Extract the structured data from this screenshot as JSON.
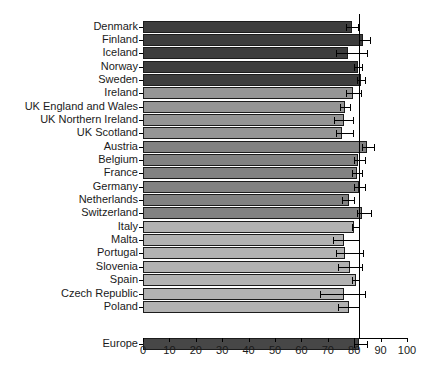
{
  "chart_data": {
    "type": "bar",
    "orientation": "horizontal",
    "title": "",
    "xlabel": "",
    "ylabel": "",
    "xlim": [
      0,
      100
    ],
    "x_tick_labels": [
      "0",
      "10",
      "20",
      "30",
      "40",
      "50",
      "60",
      "70",
      "80",
      "90",
      "100"
    ],
    "x_tick_values": [
      0,
      10,
      20,
      30,
      40,
      50,
      60,
      70,
      80,
      90,
      100
    ],
    "grid": false,
    "legend": "none",
    "reference_line": {
      "value": 82,
      "color": "#000000",
      "note": "vertical line at Europe value"
    },
    "group_colors": {
      "nordic": "#3d3d3d",
      "uk_ireland": "#959595",
      "central_western": "#828282",
      "southern_eastern": "#b2b2b2",
      "europe": "#474747"
    },
    "error_bars": true,
    "categories": [
      "Denmark",
      "Finland",
      "Iceland",
      "Norway",
      "Sweden",
      "Ireland",
      "UK England and Wales",
      "UK Northern Ireland",
      "UK Scotland",
      "Austria",
      "Belgium",
      "France",
      "Germany",
      "Netherlands",
      "Switzerland",
      "Italy",
      "Malta",
      "Portugal",
      "Slovenia",
      "Spain",
      "Czech Republic",
      "Poland",
      "Europe"
    ],
    "rows": [
      {
        "label": "Denmark",
        "value": 79.0,
        "err_low": 77.0,
        "err_high": 81.5,
        "group": "nordic"
      },
      {
        "label": "Finland",
        "value": 83.5,
        "err_low": 82.0,
        "err_high": 86.0,
        "group": "nordic"
      },
      {
        "label": "Iceland",
        "value": 77.5,
        "err_low": 73.0,
        "err_high": 85.0,
        "group": "nordic"
      },
      {
        "label": "Norway",
        "value": 81.5,
        "err_low": 80.0,
        "err_high": 83.0,
        "group": "nordic"
      },
      {
        "label": "Sweden",
        "value": 82.5,
        "err_low": 81.0,
        "err_high": 84.0,
        "group": "nordic"
      },
      {
        "label": "Ireland",
        "value": 79.5,
        "err_low": 77.0,
        "err_high": 82.5,
        "group": "uk_ireland"
      },
      {
        "label": "UK England and Wales",
        "value": 76.5,
        "err_low": 74.5,
        "err_high": 78.5,
        "group": "uk_ireland"
      },
      {
        "label": "UK Northern Ireland",
        "value": 76.0,
        "err_low": 72.5,
        "err_high": 79.5,
        "group": "uk_ireland"
      },
      {
        "label": "UK Scotland",
        "value": 75.5,
        "err_low": 73.0,
        "err_high": 79.5,
        "group": "uk_ireland"
      },
      {
        "label": "Austria",
        "value": 85.0,
        "err_low": 83.0,
        "err_high": 87.5,
        "group": "central_western"
      },
      {
        "label": "Belgium",
        "value": 81.5,
        "err_low": 80.0,
        "err_high": 84.0,
        "group": "central_western"
      },
      {
        "label": "France",
        "value": 81.0,
        "err_low": 79.0,
        "err_high": 83.0,
        "group": "central_western"
      },
      {
        "label": "Germany",
        "value": 82.0,
        "err_low": 80.0,
        "err_high": 84.0,
        "group": "central_western"
      },
      {
        "label": "Netherlands",
        "value": 78.0,
        "err_low": 75.5,
        "err_high": 80.0,
        "group": "central_western"
      },
      {
        "label": "Switzerland",
        "value": 83.0,
        "err_low": 81.0,
        "err_high": 86.5,
        "group": "central_western"
      },
      {
        "label": "Italy",
        "value": 80.0,
        "err_low": 79.0,
        "err_high": 82.0,
        "group": "southern_eastern"
      },
      {
        "label": "Malta",
        "value": 76.0,
        "err_low": 72.0,
        "err_high": 82.0,
        "group": "southern_eastern"
      },
      {
        "label": "Portugal",
        "value": 76.5,
        "err_low": 73.0,
        "err_high": 83.5,
        "group": "southern_eastern"
      },
      {
        "label": "Slovenia",
        "value": 78.5,
        "err_low": 74.0,
        "err_high": 83.0,
        "group": "southern_eastern"
      },
      {
        "label": "Spain",
        "value": 80.5,
        "err_low": 79.0,
        "err_high": 82.0,
        "group": "southern_eastern"
      },
      {
        "label": "Czech Republic",
        "value": 76.0,
        "err_low": 67.0,
        "err_high": 84.0,
        "group": "southern_eastern"
      },
      {
        "label": "Poland",
        "value": 78.0,
        "err_low": 74.0,
        "err_high": 82.0,
        "group": "southern_eastern"
      },
      {
        "label": "Europe",
        "value": 82.0,
        "err_low": 80.0,
        "err_high": 85.0,
        "group": "europe",
        "gap_before": true
      }
    ]
  }
}
